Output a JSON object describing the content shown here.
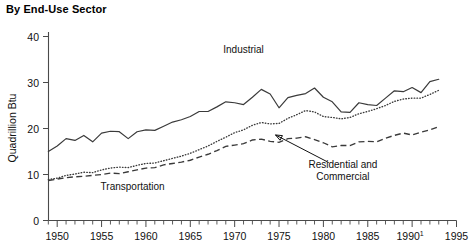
{
  "chart_data": {
    "type": "line",
    "title": "By End-Use Sector",
    "xlabel": "",
    "ylabel": "Quadrillion Btu",
    "xlim": [
      1949,
      1995
    ],
    "ylim": [
      0,
      40
    ],
    "ytick_labels": [
      "0",
      "10",
      "20",
      "30",
      "40"
    ],
    "ytick_values": [
      0,
      10,
      20,
      30,
      40
    ],
    "xtick_labels": [
      "1950",
      "1955",
      "1960",
      "1965",
      "1970",
      "1975",
      "1980",
      "1985",
      "1990",
      "1995"
    ],
    "xtick_values": [
      1950,
      1955,
      1960,
      1965,
      1970,
      1975,
      1980,
      1985,
      1990,
      1995
    ],
    "xtick_footnote_year": "1990",
    "xtick_footnote_marker": "1",
    "minor_ticks": "every year",
    "grid": false,
    "legend": "inline annotations",
    "x": [
      1949,
      1950,
      1951,
      1952,
      1953,
      1954,
      1955,
      1956,
      1957,
      1958,
      1959,
      1960,
      1961,
      1962,
      1963,
      1964,
      1965,
      1966,
      1967,
      1968,
      1969,
      1970,
      1971,
      1972,
      1973,
      1974,
      1975,
      1976,
      1977,
      1978,
      1979,
      1980,
      1981,
      1982,
      1983,
      1984,
      1985,
      1986,
      1987,
      1988,
      1989,
      1990,
      1991,
      1992,
      1993
    ],
    "series": [
      {
        "name": "Industrial",
        "style": "solid",
        "color": "#3a3a3a",
        "label_x": 1971,
        "label_y": 36.4,
        "values": [
          15.0,
          16.2,
          17.8,
          17.4,
          18.5,
          17.1,
          19.0,
          19.4,
          19.3,
          17.8,
          19.3,
          19.7,
          19.6,
          20.5,
          21.4,
          21.9,
          22.6,
          23.7,
          23.7,
          24.7,
          25.8,
          25.6,
          25.2,
          26.8,
          28.5,
          27.5,
          24.5,
          26.7,
          27.2,
          27.6,
          28.8,
          26.8,
          25.8,
          23.6,
          23.5,
          25.6,
          25.2,
          25.0,
          26.6,
          28.2,
          28.0,
          28.9,
          27.8,
          30.2,
          30.7
        ],
        "values_display_note": "solid line, upper series"
      },
      {
        "name": "Transportation",
        "style": "dotted",
        "color": "#3a3a3a",
        "label_x": 1958.5,
        "label_y": 6.6,
        "values": [
          8.9,
          9.2,
          9.8,
          10.1,
          10.5,
          10.4,
          11.0,
          11.4,
          11.6,
          11.5,
          12.0,
          12.4,
          12.5,
          13.0,
          13.5,
          14.0,
          14.6,
          15.4,
          16.2,
          17.2,
          18.1,
          19.1,
          19.7,
          20.7,
          21.3,
          21.0,
          21.1,
          22.2,
          23.0,
          23.9,
          23.6,
          22.6,
          22.4,
          22.1,
          22.4,
          23.2,
          23.7,
          24.3,
          25.0,
          25.9,
          26.4,
          26.6,
          26.6,
          27.4,
          28.3
        ],
        "values_display_note": "dotted line, middle series"
      },
      {
        "name": "Residential and Commercial",
        "style": "dashed",
        "color": "#3a3a3a",
        "label_x": 1976.2,
        "label_y": 12.2,
        "label_line2": "Commercial",
        "values": [
          8.7,
          9.0,
          9.3,
          9.5,
          9.6,
          9.8,
          10.0,
          10.3,
          10.2,
          10.6,
          11.0,
          11.4,
          11.5,
          12.1,
          12.4,
          12.7,
          13.1,
          13.8,
          14.4,
          15.2,
          16.1,
          16.4,
          16.7,
          17.5,
          17.7,
          17.2,
          17.0,
          17.8,
          17.9,
          18.2,
          17.6,
          16.9,
          16.0,
          16.3,
          16.3,
          17.1,
          17.2,
          17.1,
          17.9,
          18.5,
          19.0,
          18.6,
          19.2,
          19.7,
          20.4
        ],
        "values_display_note": "dashed line, lower series"
      }
    ],
    "annotations": [
      {
        "name": "residential-commercial-pointer",
        "text_line1": "Residential and",
        "text_line2": "Commercial",
        "arrow_from_x": 1980.6,
        "arrow_from_y": 12.6,
        "arrow_to_x": 1974.6,
        "arrow_to_y": 18.6
      }
    ]
  }
}
